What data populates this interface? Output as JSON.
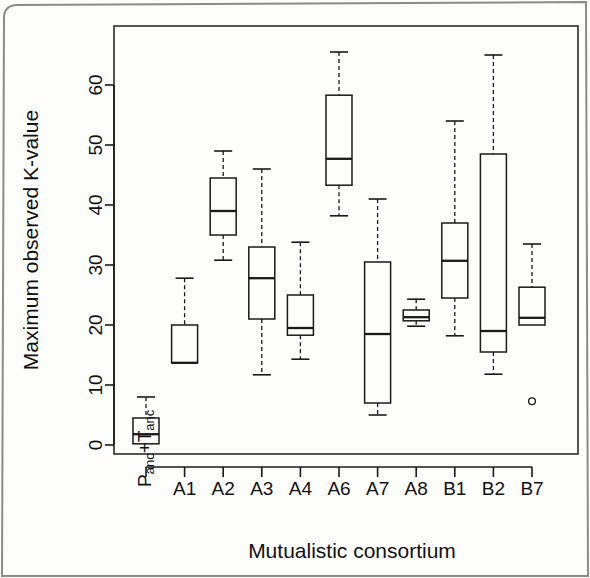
{
  "figure": {
    "background_color": "#fdfdfc",
    "line_color": "#1a1a1a",
    "outer_border_color": "#8a8a8a"
  },
  "chart_data": {
    "type": "box",
    "title": "",
    "xlabel": "Mutualistic consortium",
    "ylabel": "Maximum observed K-value",
    "ylim": [
      -2,
      69
    ],
    "yticks": [
      0,
      10,
      20,
      30,
      40,
      50,
      60
    ],
    "ytick_labels": [
      "0",
      "10",
      "20",
      "30",
      "40",
      "50",
      "60"
    ],
    "grid": false,
    "legend": null,
    "categories": [
      "P_anc+T_anc",
      "A1",
      "A2",
      "A3",
      "A4",
      "A6",
      "A7",
      "A8",
      "B1",
      "B2",
      "B7"
    ],
    "category_labels_display": [
      {
        "main": "P",
        "sub1": "anc",
        "plus": "+T",
        "sub2": "anc",
        "rotated": true,
        "text": "Panc+Tanc"
      },
      {
        "text": "A1",
        "rotated": false
      },
      {
        "text": "A2",
        "rotated": false
      },
      {
        "text": "A3",
        "rotated": false
      },
      {
        "text": "A4",
        "rotated": false
      },
      {
        "text": "A6",
        "rotated": false
      },
      {
        "text": "A7",
        "rotated": false
      },
      {
        "text": "A8",
        "rotated": false
      },
      {
        "text": "B1",
        "rotated": false
      },
      {
        "text": "B2",
        "rotated": false
      },
      {
        "text": "B7",
        "rotated": false
      }
    ],
    "boxes": [
      {
        "label": "P_anc+T_anc",
        "whisker_low": 0.2,
        "q1": 0.2,
        "median": 1.8,
        "q3": 4.5,
        "whisker_high": 8.0,
        "outliers": []
      },
      {
        "label": "A1",
        "whisker_low": 13.7,
        "q1": 13.7,
        "median": 13.7,
        "q3": 20.0,
        "whisker_high": 27.8,
        "outliers": []
      },
      {
        "label": "A2",
        "whisker_low": 30.8,
        "q1": 35.0,
        "median": 39.0,
        "q3": 44.5,
        "whisker_high": 49.0,
        "outliers": []
      },
      {
        "label": "A3",
        "whisker_low": 11.7,
        "q1": 21.0,
        "median": 27.8,
        "q3": 33.0,
        "whisker_high": 46.0,
        "outliers": []
      },
      {
        "label": "A4",
        "whisker_low": 14.3,
        "q1": 18.3,
        "median": 19.5,
        "q3": 25.0,
        "whisker_high": 33.8,
        "outliers": []
      },
      {
        "label": "A6",
        "whisker_low": 38.2,
        "q1": 43.3,
        "median": 47.7,
        "q3": 58.3,
        "whisker_high": 65.5,
        "outliers": []
      },
      {
        "label": "A7",
        "whisker_low": 5.0,
        "q1": 7.0,
        "median": 18.5,
        "q3": 30.5,
        "whisker_high": 41.0,
        "outliers": []
      },
      {
        "label": "A8",
        "whisker_low": 19.8,
        "q1": 20.7,
        "median": 21.3,
        "q3": 22.5,
        "whisker_high": 24.3,
        "outliers": []
      },
      {
        "label": "B1",
        "whisker_low": 18.2,
        "q1": 24.5,
        "median": 30.7,
        "q3": 37.0,
        "whisker_high": 54.0,
        "outliers": []
      },
      {
        "label": "B2",
        "whisker_low": 11.8,
        "q1": 15.5,
        "median": 19.0,
        "q3": 48.5,
        "whisker_high": 65.0,
        "outliers": []
      },
      {
        "label": "B7",
        "whisker_low": 20.0,
        "q1": 20.0,
        "median": 21.2,
        "q3": 26.3,
        "whisker_high": 33.5,
        "outliers": [
          7.3
        ]
      }
    ]
  }
}
